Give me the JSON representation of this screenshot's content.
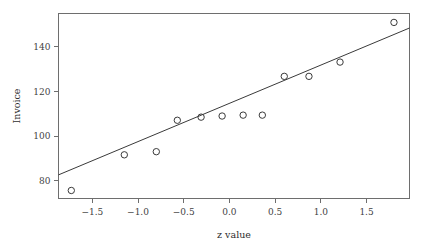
{
  "chart_data": {
    "type": "scatter",
    "title": "",
    "xlabel": "z value",
    "ylabel": "Invoice",
    "xlim": [
      -1.87,
      1.97
    ],
    "ylim": [
      72.0,
      155.0
    ],
    "grid": false,
    "legend": null,
    "x_ticks": [
      -1.5,
      -1.0,
      -0.5,
      0.0,
      0.5,
      1.0,
      1.5
    ],
    "x_tick_labels": [
      "-1.5",
      "-1.0",
      "-0.5",
      "0.0",
      "0.5",
      "1.0",
      "1.5"
    ],
    "y_ticks": [
      80,
      100,
      120,
      140
    ],
    "y_tick_labels": [
      "80",
      "100",
      "120",
      "140"
    ],
    "points": [
      {
        "x": -1.73,
        "y": 75.6
      },
      {
        "x": -1.15,
        "y": 91.6
      },
      {
        "x": -0.8,
        "y": 93.0
      },
      {
        "x": -0.57,
        "y": 107.1
      },
      {
        "x": -0.31,
        "y": 108.5
      },
      {
        "x": -0.08,
        "y": 109.0
      },
      {
        "x": 0.15,
        "y": 109.4
      },
      {
        "x": 0.36,
        "y": 109.4
      },
      {
        "x": 0.6,
        "y": 126.8
      },
      {
        "x": 0.87,
        "y": 126.8
      },
      {
        "x": 1.21,
        "y": 133.2
      },
      {
        "x": 1.8,
        "y": 151.0
      }
    ],
    "marker": "open-circle",
    "marker_radius": 3.2,
    "fit_line": {
      "type": "straight",
      "x1": -1.87,
      "y1": 82.6,
      "x2": 1.97,
      "y2": 148.5,
      "slope": 17.16,
      "intercept": 114.7
    },
    "colors": {
      "axis": "#6e6e6e",
      "text": "#3f3f3f",
      "marker": "#3a3a3a",
      "line": "#3a3a3a",
      "background": "#ffffff"
    }
  }
}
